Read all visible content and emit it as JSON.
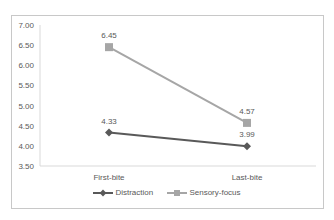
{
  "chart_data": {
    "type": "line",
    "title": "",
    "xlabel": "",
    "ylabel": "",
    "categories": [
      "First-bite",
      "Last-bite"
    ],
    "series": [
      {
        "name": "Distraction",
        "values": [
          4.33,
          3.99
        ],
        "color": "#595959",
        "marker": "diamond"
      },
      {
        "name": "Sensory-focus",
        "values": [
          6.45,
          4.57
        ],
        "color": "#a6a6a6",
        "marker": "square"
      }
    ],
    "ylim": [
      3.5,
      7.0
    ],
    "yticks": [
      "7.00",
      "6.50",
      "6.00",
      "5.50",
      "5.00",
      "4.50",
      "4.00",
      "3.50"
    ],
    "data_labels": {
      "Distraction": [
        "4.33",
        "3.99"
      ],
      "Sensory-focus": [
        "6.45",
        "4.57"
      ]
    },
    "grid": false,
    "legend_position": "bottom"
  },
  "legend": {
    "items": [
      {
        "label": "Distraction",
        "color": "#595959"
      },
      {
        "label": "Sensory-focus",
        "color": "#a6a6a6"
      }
    ]
  }
}
